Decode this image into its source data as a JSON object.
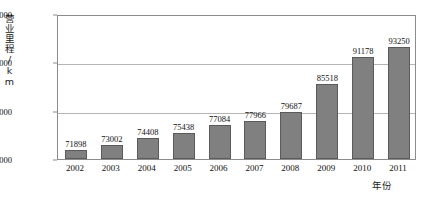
{
  "chart_data": {
    "type": "bar",
    "title": "",
    "subtitle": "",
    "xlabel": "年份",
    "ylabel": "营业里程/km",
    "categories": [
      "2002",
      "2003",
      "2004",
      "2005",
      "2006",
      "2007",
      "2008",
      "2009",
      "2010",
      "2011"
    ],
    "values": [
      71898,
      73002,
      74408,
      75438,
      77084,
      77966,
      79687,
      85518,
      91178,
      93250
    ],
    "data_labels": [
      "71898",
      "73002",
      "74408",
      "75438",
      "77084",
      "77966",
      "79687",
      "85518",
      "91178",
      "93250"
    ],
    "ylim": [
      70000,
      100000
    ],
    "yticks": [
      70000,
      80000,
      90000,
      100000
    ],
    "ytick_labels": [
      "70000",
      "80000",
      "90000",
      "100000"
    ],
    "gridlines": [
      80000,
      90000
    ],
    "grid": true,
    "legend": null,
    "legend_position": "none",
    "bar_color": "#808080",
    "bar_border_color": "#5a5a5a",
    "grid_color": "#b5b5b5",
    "axis_color": "#8c8c8c",
    "text_color": "#111111",
    "background": "#ffffff"
  }
}
